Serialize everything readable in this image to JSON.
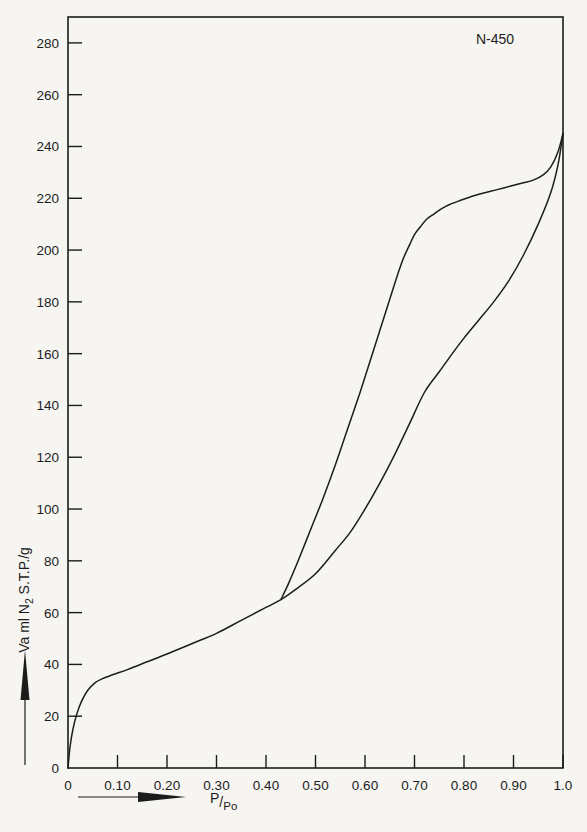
{
  "chart_data": {
    "type": "line",
    "title": "",
    "annotation": "N-450",
    "xlabel": "P/Po",
    "ylabel": "Va ml N2 S.T.P./g",
    "ylabel_parts": {
      "pre": "Va ml N",
      "sub": "2",
      "post": " S.T.P./g"
    },
    "xlabel_parts": {
      "numerator": "P",
      "slash": "/",
      "denominator": "Po"
    },
    "xlim": [
      0,
      1.0
    ],
    "ylim": [
      0,
      290
    ],
    "grid": false,
    "legend": "none",
    "xticks": [
      0,
      0.1,
      0.2,
      0.3,
      0.4,
      0.5,
      0.6,
      0.7,
      0.8,
      0.9,
      1.0
    ],
    "xtick_labels": [
      "0",
      "0.10",
      "0.20",
      "0.30",
      "0.40",
      "0.50",
      "0.60",
      "0.70",
      "0.80",
      "0.90",
      "1.0"
    ],
    "yticks": [
      0,
      20,
      40,
      60,
      80,
      100,
      120,
      140,
      160,
      180,
      200,
      220,
      240,
      260,
      280
    ],
    "ytick_labels": [
      "0",
      "20",
      "40",
      "60",
      "80",
      "100",
      "120",
      "140",
      "160",
      "180",
      "200",
      "220",
      "240",
      "260",
      "280"
    ],
    "series": [
      {
        "name": "adsorption",
        "x": [
          0.0,
          0.004,
          0.01,
          0.018,
          0.028,
          0.04,
          0.055,
          0.07,
          0.09,
          0.12,
          0.16,
          0.2,
          0.25,
          0.3,
          0.35,
          0.4,
          0.43,
          0.46,
          0.5,
          0.54,
          0.57,
          0.6,
          0.63,
          0.66,
          0.69,
          0.72,
          0.75,
          0.78,
          0.8,
          0.83,
          0.86,
          0.89,
          0.92,
          0.95,
          0.975,
          0.99,
          1.0
        ],
        "y": [
          0,
          8,
          15,
          21,
          26,
          30,
          33,
          34.5,
          36,
          38,
          41,
          44,
          48,
          52,
          57,
          62,
          65,
          69,
          75,
          84,
          91,
          100,
          110,
          121,
          133,
          145,
          153,
          161,
          166,
          173,
          180,
          188,
          198,
          210,
          222,
          233,
          245
        ]
      },
      {
        "name": "desorption",
        "x": [
          1.0,
          0.99,
          0.975,
          0.96,
          0.94,
          0.91,
          0.88,
          0.85,
          0.82,
          0.79,
          0.77,
          0.755,
          0.74,
          0.725,
          0.712,
          0.7,
          0.69,
          0.678,
          0.665,
          0.65,
          0.63,
          0.61,
          0.59,
          0.565,
          0.54,
          0.515,
          0.49,
          0.465,
          0.445,
          0.43
        ],
        "y": [
          245,
          238,
          232,
          229,
          227,
          225.5,
          224,
          222.5,
          221,
          219,
          217.5,
          216,
          214,
          212,
          209,
          206,
          202,
          197,
          190,
          181,
          169,
          157,
          145,
          131,
          117,
          104,
          92,
          80,
          71,
          65
        ]
      }
    ],
    "notes": {
      "hysteresis_closure_point": {
        "x": 0.43,
        "y": 65
      },
      "monolayer_knee": {
        "x": 0.05,
        "y": 33
      },
      "plateau_value": 225,
      "max_uptake": 245
    }
  },
  "axis_arrows": {
    "x_arrow_name": "x-axis-direction-arrow",
    "y_arrow_name": "y-axis-direction-arrow"
  }
}
